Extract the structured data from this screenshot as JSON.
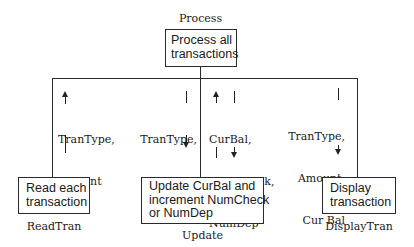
{
  "diagram": {
    "type": "structure-chart",
    "root": {
      "module_name": "Process",
      "box_text": [
        "Process all",
        "transactions"
      ]
    },
    "children": [
      {
        "module_name": "ReadTran",
        "box_text": [
          "Read each",
          "transaction"
        ]
      },
      {
        "module_name": "Update",
        "box_text": [
          "Update CurBal and",
          "increment NumCheck",
          "or NumDep"
        ]
      },
      {
        "module_name": "DisplayTran",
        "box_text": [
          "Display",
          "transaction"
        ]
      }
    ],
    "data_flows": [
      {
        "to_module": "ReadTran",
        "direction": "up",
        "params": [
          "TranType,",
          "Amount"
        ]
      },
      {
        "to_module": "Update",
        "direction": "down",
        "params": [
          "TranType,",
          "Amount"
        ]
      },
      {
        "to_module": "Update",
        "direction": "up-and-down",
        "params": [
          "CurBal,",
          "NumCheck,",
          "NumDep"
        ]
      },
      {
        "to_module": "DisplayTran",
        "direction": "down",
        "params": [
          "TranType,",
          "Amount,",
          "Cur Bal"
        ]
      }
    ]
  }
}
